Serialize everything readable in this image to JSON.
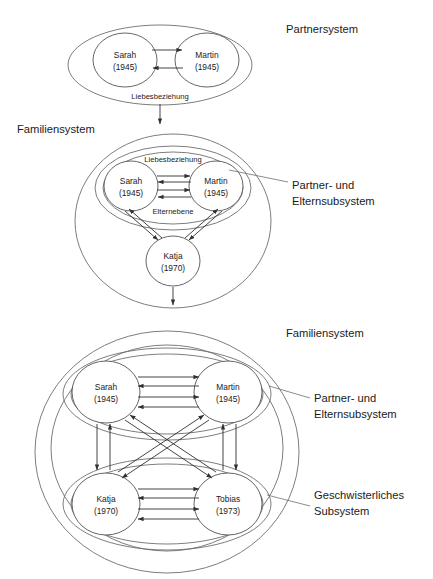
{
  "document": {
    "title": "Partnersystem, Familiensystem und Subsysteme",
    "language": "de"
  },
  "style": {
    "background": "#ffffff",
    "ellipse_stroke": "#6e6e6e",
    "node_stroke": "#555555",
    "arrow_stroke": "#303030",
    "text_color": "#1a1a1a",
    "leader_stroke": "#6e6e6e"
  },
  "panels": [
    {
      "id": "panel-partnersystem",
      "system_label": "Partnersystem",
      "nodes": [
        {
          "id": "sarah",
          "name": "Sarah",
          "year": "(1945)"
        },
        {
          "id": "martin",
          "name": "Martin",
          "year": "(1945)"
        }
      ],
      "edge_labels": [
        "Liebesbeziehung"
      ],
      "relations": [
        {
          "from": "sarah",
          "to": "martin",
          "label": "Liebesbeziehung"
        },
        {
          "from": "martin",
          "to": "sarah",
          "label": "Liebesbeziehung"
        }
      ],
      "outflow": "arrow-down-to-familiensystem"
    },
    {
      "id": "panel-familiensystem-1",
      "system_label": "Familiensystem",
      "callout_label": "Partner- und\nElternsubsystem",
      "callout_line1": "Partner- und",
      "callout_line2": "Elternsubsystem",
      "nodes": [
        {
          "id": "sarah",
          "name": "Sarah",
          "year": "(1945)"
        },
        {
          "id": "martin",
          "name": "Martin",
          "year": "(1945)"
        },
        {
          "id": "katja",
          "name": "Katja",
          "year": "(1970)"
        }
      ],
      "edge_labels": [
        "Liebesbeziehung",
        "Elternebene"
      ],
      "relations": [
        {
          "from": "sarah",
          "to": "martin",
          "label": "Liebesbeziehung"
        },
        {
          "from": "martin",
          "to": "sarah",
          "label": "Liebesbeziehung"
        },
        {
          "from": "sarah",
          "to": "martin",
          "label": "Elternebene"
        },
        {
          "from": "martin",
          "to": "sarah",
          "label": "Elternebene"
        },
        {
          "from": "sarah",
          "to": "katja",
          "label": ""
        },
        {
          "from": "katja",
          "to": "sarah",
          "label": ""
        },
        {
          "from": "martin",
          "to": "katja",
          "label": ""
        },
        {
          "from": "katja",
          "to": "martin",
          "label": ""
        }
      ],
      "outflow": "arrow-down-to-familiensystem-2"
    },
    {
      "id": "panel-familiensystem-2",
      "system_label": "Familiensystem",
      "callout_partner_line1": "Partner- und",
      "callout_partner_line2": "Elternsubsystem",
      "callout_sibling_line1": "Geschwisterliches",
      "callout_sibling_line2": "Subsystem",
      "nodes": [
        {
          "id": "sarah",
          "name": "Sarah",
          "year": "(1945)"
        },
        {
          "id": "martin",
          "name": "Martin",
          "year": "(1945)"
        },
        {
          "id": "katja",
          "name": "Katja",
          "year": "(1970)"
        },
        {
          "id": "tobias",
          "name": "Tobias",
          "year": "(1973)"
        }
      ],
      "edge_labels": [],
      "relations": [
        {
          "from": "sarah",
          "to": "martin",
          "label": ""
        },
        {
          "from": "martin",
          "to": "sarah",
          "label": ""
        },
        {
          "from": "katja",
          "to": "tobias",
          "label": ""
        },
        {
          "from": "tobias",
          "to": "katja",
          "label": ""
        },
        {
          "from": "sarah",
          "to": "katja",
          "label": ""
        },
        {
          "from": "katja",
          "to": "sarah",
          "label": ""
        },
        {
          "from": "martin",
          "to": "tobias",
          "label": ""
        },
        {
          "from": "tobias",
          "to": "martin",
          "label": ""
        },
        {
          "from": "sarah",
          "to": "tobias",
          "label": ""
        },
        {
          "from": "tobias",
          "to": "sarah",
          "label": ""
        },
        {
          "from": "martin",
          "to": "katja",
          "label": ""
        },
        {
          "from": "katja",
          "to": "martin",
          "label": ""
        }
      ]
    }
  ]
}
